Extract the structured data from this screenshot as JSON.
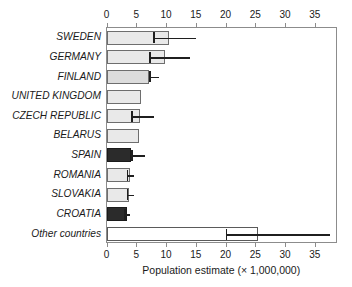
{
  "chart_data": {
    "type": "bar",
    "orientation": "horizontal",
    "title": "",
    "xlabel": "Population estimate (× 1,000,000)",
    "ylabel": "",
    "xlim": [
      0,
      38.9
    ],
    "xticks": [
      0,
      5,
      10,
      15,
      20,
      25,
      30,
      35
    ],
    "xticklabels": [
      "0",
      "5",
      "10",
      "15",
      "20",
      "25",
      "30",
      "35"
    ],
    "axis_top": true,
    "axis_bottom": true,
    "grid": false,
    "legend": null,
    "categories": [
      "SWEDEN",
      "GERMANY",
      "FINLAND",
      "UNITED KINGDOM",
      "CZECH REPUBLIC",
      "BELARUS",
      "SPAIN",
      "ROMANIA",
      "SLOVAKIA",
      "CROATIA",
      "Other countries"
    ],
    "values": [
      10.5,
      9.9,
      7.2,
      5.8,
      5.6,
      5.4,
      4.2,
      3.9,
      3.8,
      3.4,
      25.4
    ],
    "error_low": [
      7.8,
      7.2,
      7.2,
      null,
      4.2,
      null,
      4.2,
      3.4,
      3.4,
      3.0,
      20.0
    ],
    "error_high": [
      15.0,
      14.0,
      8.8,
      null,
      8.0,
      null,
      6.4,
      4.7,
      4.6,
      3.9,
      37.5
    ],
    "fills": [
      "light",
      "light",
      "medium",
      "light",
      "light",
      "light",
      "dark",
      "light",
      "light",
      "dark",
      "white"
    ],
    "colors": {
      "light": "#e9e9e9",
      "medium": "#dcdcdc",
      "dark": "#2b2b2b",
      "white": "#ffffff",
      "edge": "#6e6e6e",
      "error": "#1f1f1f",
      "axis": "#8c8c8c",
      "text": "#1a1a1a"
    }
  }
}
